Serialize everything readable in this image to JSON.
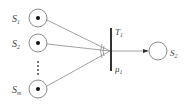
{
  "diagram": {
    "type": "petri-net",
    "input_places": [
      {
        "label": "S",
        "sub": "1",
        "token": true
      },
      {
        "label": "S",
        "sub": "2",
        "token": true
      },
      {
        "label": "S",
        "sub": "m",
        "token": true
      }
    ],
    "ellipsis": "⋮",
    "transition": {
      "label": "T",
      "sub": "1",
      "rate_label": "μ",
      "rate_sub": "1"
    },
    "output_place": {
      "label": "S",
      "sub": "2",
      "token": false
    },
    "colors": {
      "stroke": "#8a8a8a",
      "bar": "#333333",
      "token": "#111111",
      "text": "#444444"
    }
  }
}
